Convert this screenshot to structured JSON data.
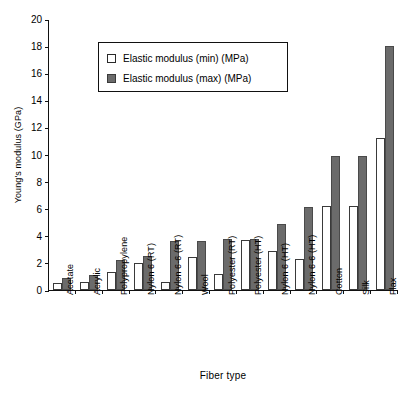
{
  "chart_data": {
    "type": "bar",
    "title": "",
    "xlabel": "Fiber type",
    "ylabel": "Young's modulus (GPa)",
    "ylim": [
      0,
      20
    ],
    "ytick_step": 2,
    "yticks": [
      20,
      18,
      16,
      14,
      12,
      10,
      8,
      6,
      4,
      2,
      0
    ],
    "grid": false,
    "legend_position": "upper-left-inset",
    "categories": [
      "Acetate",
      "Acrylic",
      "Polypropylene",
      "Nylon 6 (RT)",
      "Nylon 6-6 (RT)",
      "Wool",
      "Polyester (RT)",
      "Polyester (HT)",
      "Nylon 6 (HT)",
      "Nylon 6-6 (HT)",
      "Cotton",
      "Silk",
      "Flax"
    ],
    "series": [
      {
        "name": "Elastic modulus (min) (MPa)",
        "color": "#ffffff",
        "values": [
          0.5,
          0.6,
          1.3,
          2.0,
          0.6,
          2.4,
          1.2,
          3.7,
          2.9,
          2.3,
          6.2,
          6.2,
          11.2
        ]
      },
      {
        "name": "Elastic modulus (max) (MPa)",
        "color": "#6b6b6b",
        "values": [
          0.9,
          1.1,
          2.2,
          2.5,
          3.6,
          3.6,
          3.8,
          3.8,
          4.9,
          6.1,
          9.9,
          9.9,
          18.0
        ]
      }
    ]
  },
  "legend": {
    "items": [
      {
        "label": "Elastic modulus (min) (MPa)",
        "swatch": "legend-swatch-min"
      },
      {
        "label": "Elastic modulus (max) (MPa)",
        "swatch": "legend-swatch-max"
      }
    ]
  }
}
